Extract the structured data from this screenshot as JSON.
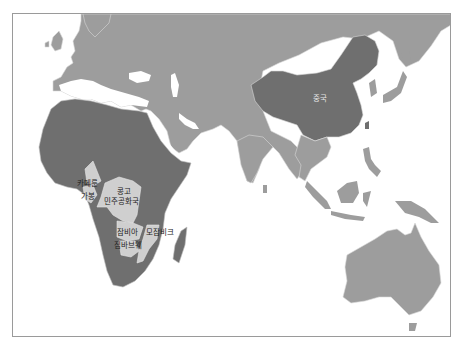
{
  "map": {
    "projection": "Asia-Africa-Oceania region",
    "colors": {
      "ocean": "#ffffff",
      "frame": "#9a9a9a",
      "other_countries": "#9d9d9d",
      "africa_and_china": "#6f6f6f",
      "highlighted": "#cfcfcf",
      "borders": "#d8d8d8"
    },
    "labels": {
      "china": "중국",
      "cameroon": "카메룬",
      "gabon": "가봉",
      "drc_line1": "콩고",
      "drc_line2": "민주공화국",
      "zambia": "잠비아",
      "mozambique": "모잠비크",
      "zimbabwe": "짐바브웨"
    },
    "highlighted_countries": [
      "카메룬",
      "가봉",
      "콩고 민주공화국",
      "잠비아",
      "모잠비크",
      "짐바브웨"
    ],
    "dark_regions": [
      "중국",
      "Africa"
    ]
  }
}
